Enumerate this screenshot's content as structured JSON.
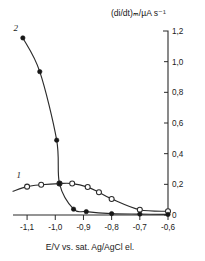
{
  "chart_data": {
    "type": "line",
    "title": "",
    "ylabel": "(di/dt)ₘ/µA s⁻¹",
    "xlabel": "E/V vs. sat. Ag/AgCl el.",
    "xlim": [
      -1.15,
      -0.6
    ],
    "ylim": [
      0,
      1.2
    ],
    "grid": false,
    "legend_position": "inline-curve-labels",
    "xticks": [
      -1.1,
      -1.0,
      -0.9,
      -0.8,
      -0.7,
      -0.6
    ],
    "xticklabels": [
      "-1,1",
      "-1,0",
      "-0,9",
      "-0,8",
      "-0,7",
      "-0,6"
    ],
    "yticks": [
      0,
      0.2,
      0.4,
      0.6,
      0.8,
      1.0,
      1.2
    ],
    "yticklabels": [
      "0",
      "0,2",
      "0,4",
      "0,6",
      "0,8",
      "1,0",
      "1,2"
    ],
    "yaxis_position": "right",
    "series": [
      {
        "name": "1",
        "label": "1",
        "marker": "open-circle",
        "x": [
          -1.15,
          -1.1,
          -1.05,
          -0.985,
          -0.94,
          -0.885,
          -0.845,
          -0.8,
          -0.7,
          -0.6
        ],
        "values": [
          0.155,
          0.185,
          0.197,
          0.205,
          0.205,
          0.182,
          0.148,
          0.105,
          0.034,
          0.024
        ]
      },
      {
        "name": "2",
        "label": "2",
        "marker": "filled-circle",
        "x": [
          -1.115,
          -1.055,
          -0.995,
          -0.985,
          -0.935,
          -0.89,
          -0.8,
          -0.7,
          -0.6
        ],
        "values": [
          1.155,
          0.935,
          0.488,
          0.205,
          0.038,
          0.022,
          0.009,
          0.006,
          0.004
        ]
      }
    ],
    "annotations": [
      {
        "text": "1",
        "x": -1.13,
        "y": 0.24,
        "style": "italic"
      },
      {
        "text": "2",
        "x": -1.14,
        "y": 1.2,
        "style": "italic"
      }
    ]
  }
}
